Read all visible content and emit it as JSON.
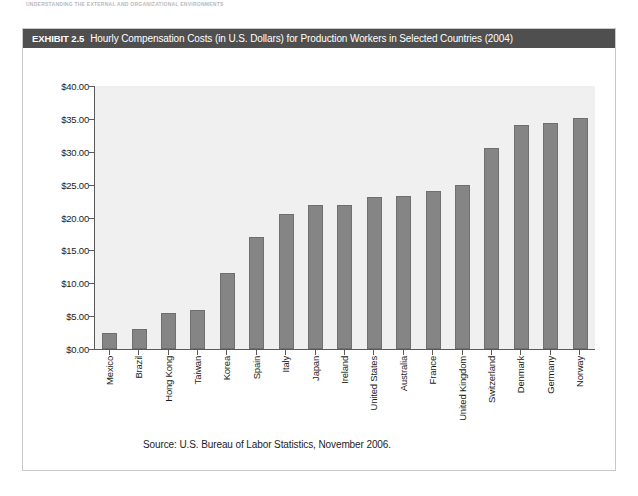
{
  "running_head": "UNDERSTANDING THE EXTERNAL AND ORGANIZATIONAL ENVIRONMENTS",
  "exhibit": {
    "label": "EXHIBIT 2.5",
    "title": "Hourly Compensation Costs (in U.S. Dollars) for Production Workers in Selected Countries (2004)"
  },
  "source_note": "Source: U.S. Bureau of Labor Statistics, November 2006.",
  "colors": {
    "title_bar": "#4f4f4f",
    "title_text": "#ffffff",
    "bar_fill": "#858585",
    "bar_stroke": "#6f6f6f",
    "plot_background": "#eff0ef",
    "axis_line": "#5a5a5a",
    "box_border": "#c9c9c9"
  },
  "chart_data": {
    "type": "bar",
    "title": "Hourly Compensation Costs (in U.S. Dollars) for Production Workers in Selected Countries (2004)",
    "xlabel": "",
    "ylabel": "",
    "ylim": [
      0,
      40
    ],
    "ytick_values": [
      0,
      5,
      10,
      15,
      20,
      25,
      30,
      35,
      40
    ],
    "ytick_labels": [
      "$0.00",
      "$5.00",
      "$10.00",
      "$15.00",
      "$20.00",
      "$25.00",
      "$30.00",
      "$35.00",
      "$40.00"
    ],
    "grid": false,
    "legend": "none",
    "categories": [
      "Mexico",
      "Brazil",
      "Hong Kong",
      "Taiwan",
      "Korea",
      "Spain",
      "Italy",
      "Japan",
      "Ireland",
      "United States",
      "Australia",
      "France",
      "United Kingdom",
      "Switzerland",
      "Denmark",
      "Germany",
      "Norway"
    ],
    "values": [
      2.5,
      3.03,
      5.51,
      5.97,
      11.52,
      17.1,
      20.48,
      21.9,
      21.94,
      23.17,
      23.32,
      24.0,
      25.0,
      30.5,
      34.0,
      34.3,
      35.1
    ]
  }
}
